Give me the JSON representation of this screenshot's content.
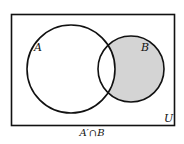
{
  "diagram": {
    "type": "venn",
    "universe_label": "U",
    "sets": [
      {
        "label": "A"
      },
      {
        "label": "B"
      }
    ],
    "shaded_region": "B only (A' ∩ B)",
    "caption": "A′∩B",
    "colors": {
      "shade": "#d4d4d4",
      "stroke": "#111111"
    }
  }
}
